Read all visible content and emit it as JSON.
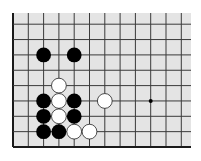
{
  "board": {
    "type": "go-board-fragment",
    "background": "#e4e4e4",
    "line_color": "#3a3a3a",
    "border_color": "#1a1a1a",
    "origin_x": 13,
    "origin_y": 147,
    "spacing_x": 15.3,
    "spacing_y": 15.35,
    "columns": 12,
    "rows": 9,
    "top_edge_y": 13,
    "right_edge_x": 191,
    "star_points": [
      {
        "col": 9,
        "row": 3
      }
    ],
    "stones": [
      {
        "color": "black",
        "col": 2,
        "row": 6
      },
      {
        "color": "black",
        "col": 4,
        "row": 6
      },
      {
        "color": "white",
        "col": 3,
        "row": 4
      },
      {
        "color": "black",
        "col": 2,
        "row": 3
      },
      {
        "color": "white",
        "col": 3,
        "row": 3
      },
      {
        "color": "black",
        "col": 4,
        "row": 3
      },
      {
        "color": "white",
        "col": 6,
        "row": 3
      },
      {
        "color": "black",
        "col": 2,
        "row": 2
      },
      {
        "color": "white",
        "col": 3,
        "row": 2
      },
      {
        "color": "black",
        "col": 4,
        "row": 2
      },
      {
        "color": "black",
        "col": 2,
        "row": 1
      },
      {
        "color": "black",
        "col": 3,
        "row": 1
      },
      {
        "color": "white",
        "col": 4,
        "row": 1
      },
      {
        "color": "white",
        "col": 5,
        "row": 1
      }
    ],
    "colors": {
      "black": "#000000",
      "white": "#ffffff",
      "white_outline": "#222222"
    }
  }
}
